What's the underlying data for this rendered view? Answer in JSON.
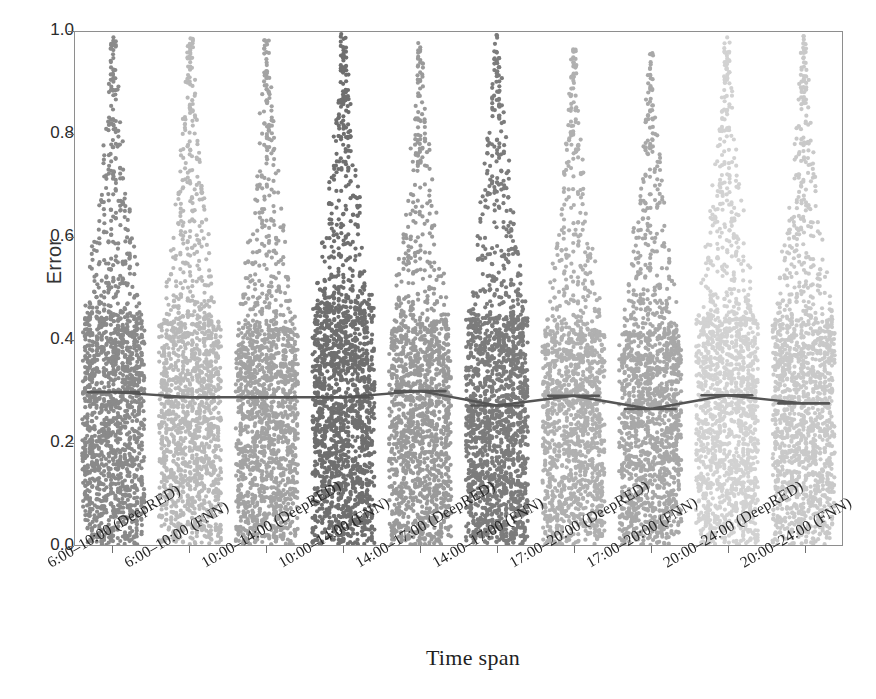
{
  "chart_data": {
    "type": "scatter",
    "plot_style": "beeswarm-strip-with-median-line",
    "title": "",
    "xlabel": "Time span",
    "ylabel": "Error",
    "ylim": [
      0.0,
      1.0
    ],
    "ytick_labels": [
      "0.0",
      "0.2",
      "0.4",
      "0.6",
      "0.8",
      "1.0"
    ],
    "ytick_values": [
      0.0,
      0.2,
      0.4,
      0.6,
      0.8,
      1.0
    ],
    "grid": false,
    "legend": "none",
    "categories": [
      "6:00–10:00 (DeepRED)",
      "6:00–10:00 (FNN)",
      "10:00–14:00 (DeepRED)",
      "10:00–14:00 (FNN)",
      "14:00–17:00 (DeepRED)",
      "14:00–17:00 (FNN)",
      "17:00–20:00 (DeepRED)",
      "17:00–20:00 (FNN)",
      "20:00–24:00 (DeepRED)",
      "20:00–24:00 (FNN)"
    ],
    "series": [
      {
        "name": "Median error",
        "values": [
          0.298,
          0.288,
          0.288,
          0.288,
          0.3,
          0.272,
          0.291,
          0.265,
          0.292,
          0.276
        ]
      }
    ],
    "group_colors": [
      "#8a8a8a",
      "#b9b9b9",
      "#a3a3a3",
      "#6f6f6f",
      "#9a9a9a",
      "#7c7c7c",
      "#b0b0b0",
      "#a8a8a8",
      "#d2d2d2",
      "#c9c9c9"
    ],
    "group_stats": [
      {
        "category": "6:00–10:00 (DeepRED)",
        "median": 0.298,
        "q1": 0.145,
        "q3": 0.47,
        "max_visible": 0.99,
        "min_visible": 0.0,
        "bulk_top": 0.44,
        "n_points": 1600
      },
      {
        "category": "6:00–10:00 (FNN)",
        "median": 0.288,
        "q1": 0.14,
        "q3": 0.455,
        "max_visible": 0.99,
        "min_visible": 0.0,
        "bulk_top": 0.43,
        "n_points": 1500
      },
      {
        "category": "10:00–14:00 (DeepRED)",
        "median": 0.288,
        "q1": 0.14,
        "q3": 0.45,
        "max_visible": 0.99,
        "min_visible": 0.0,
        "bulk_top": 0.42,
        "n_points": 1550
      },
      {
        "category": "10:00–14:00 (FNN)",
        "median": 0.288,
        "q1": 0.15,
        "q3": 0.48,
        "max_visible": 1.0,
        "min_visible": 0.0,
        "bulk_top": 0.46,
        "n_points": 1750
      },
      {
        "category": "14:00–17:00 (DeepRED)",
        "median": 0.3,
        "q1": 0.145,
        "q3": 0.44,
        "max_visible": 0.98,
        "min_visible": 0.0,
        "bulk_top": 0.42,
        "n_points": 1500
      },
      {
        "category": "14:00–17:00 (FNN)",
        "median": 0.272,
        "q1": 0.13,
        "q3": 0.46,
        "max_visible": 1.0,
        "min_visible": 0.0,
        "bulk_top": 0.44,
        "n_points": 1700
      },
      {
        "category": "17:00–20:00 (DeepRED)",
        "median": 0.291,
        "q1": 0.14,
        "q3": 0.43,
        "max_visible": 0.97,
        "min_visible": 0.0,
        "bulk_top": 0.41,
        "n_points": 1450
      },
      {
        "category": "17:00–20:00 (FNN)",
        "median": 0.265,
        "q1": 0.128,
        "q3": 0.425,
        "max_visible": 0.96,
        "min_visible": 0.0,
        "bulk_top": 0.41,
        "n_points": 1450
      },
      {
        "category": "20:00–24:00 (DeepRED)",
        "median": 0.292,
        "q1": 0.142,
        "q3": 0.46,
        "max_visible": 0.99,
        "min_visible": 0.0,
        "bulk_top": 0.44,
        "n_points": 1550
      },
      {
        "category": "20:00–24:00 (FNN)",
        "median": 0.276,
        "q1": 0.135,
        "q3": 0.45,
        "max_visible": 1.0,
        "min_visible": 0.0,
        "bulk_top": 0.43,
        "n_points": 1500
      }
    ],
    "median_line_color": "#555555",
    "point_diameter_px": 4.2,
    "axis_color": "#8e8e8e"
  }
}
